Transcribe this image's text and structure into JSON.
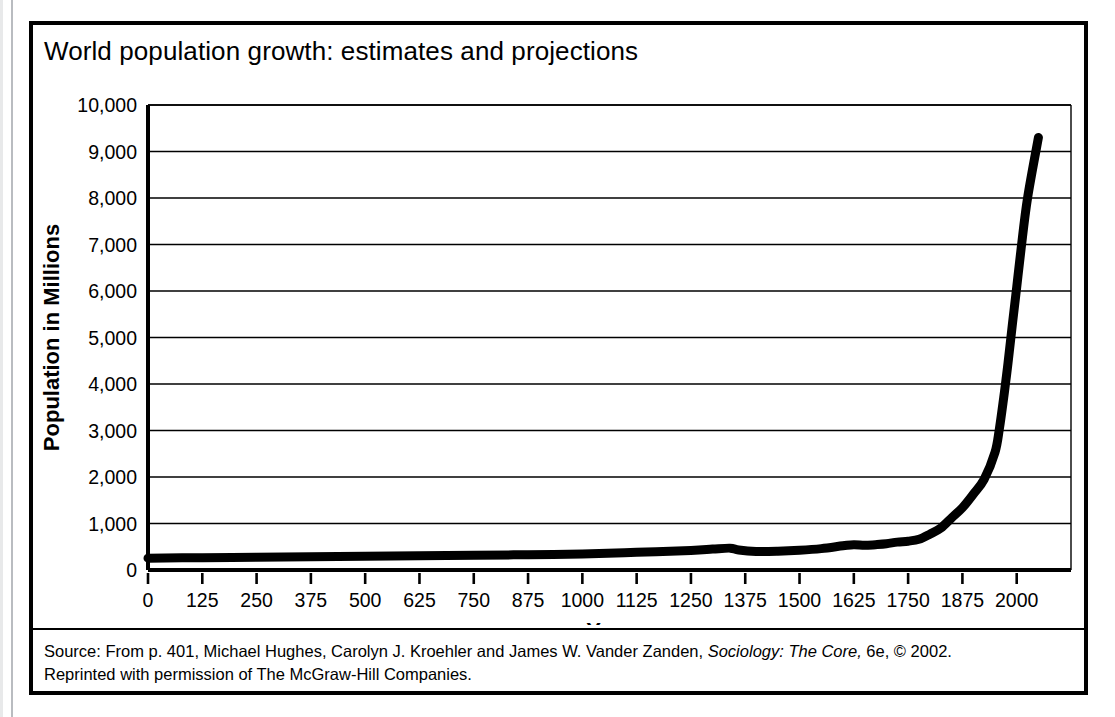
{
  "figure": {
    "title": "World population growth: estimates and projections",
    "caption_line1_pre": "Source: From p. 401, Michael Hughes, Carolyn J. Kroehler and James W. Vander Zanden, ",
    "caption_line1_italic": "Sociology: The Core,",
    "caption_line1_post": " 6e, © 2002.",
    "caption_line2": "Reprinted with permission of The McGraw-Hill Companies.",
    "frame_color": "#000000",
    "background_color": "#ffffff"
  },
  "chart_data": {
    "type": "line",
    "title": "World population growth: estimates and projections",
    "xlabel": "Year",
    "ylabel": "Population in Millions",
    "xlim": [
      0,
      2125
    ],
    "ylim": [
      0,
      10000
    ],
    "xticks": [
      0,
      125,
      250,
      375,
      500,
      625,
      750,
      875,
      1000,
      1125,
      1250,
      1375,
      1500,
      1625,
      1750,
      1875,
      2000
    ],
    "xtick_labels": [
      "0",
      "125",
      "250",
      "375",
      "500",
      "625",
      "750",
      "875",
      "1000",
      "1125",
      "1250",
      "1375",
      "1500",
      "1625",
      "1750",
      "1875",
      "2000"
    ],
    "yticks": [
      0,
      1000,
      2000,
      3000,
      4000,
      5000,
      6000,
      7000,
      8000,
      9000,
      10000
    ],
    "ytick_labels": [
      "0",
      "1,000",
      "2,000",
      "3,000",
      "4,000",
      "5,000",
      "6,000",
      "7,000",
      "8,000",
      "9,000",
      "10,000"
    ],
    "grid": "horizontal",
    "legend": null,
    "line_color": "#000000",
    "line_width": 9,
    "series": [
      {
        "name": "World population",
        "x": [
          0,
          125,
          250,
          375,
          500,
          625,
          750,
          875,
          1000,
          1125,
          1250,
          1300,
          1340,
          1360,
          1400,
          1450,
          1500,
          1550,
          1600,
          1625,
          1650,
          1675,
          1700,
          1725,
          1750,
          1775,
          1800,
          1825,
          1850,
          1875,
          1900,
          1925,
          1950,
          1960,
          1970,
          1975,
          1980,
          1990,
          2000,
          2010,
          2025,
          2050
        ],
        "y": [
          255,
          265,
          275,
          285,
          295,
          305,
          315,
          330,
          345,
          380,
          420,
          450,
          470,
          430,
          400,
          405,
          425,
          460,
          520,
          545,
          530,
          545,
          565,
          600,
          620,
          660,
          770,
          900,
          1120,
          1340,
          1630,
          1950,
          2530,
          3030,
          3700,
          4070,
          4450,
          5280,
          6080,
          6900,
          8000,
          9300
        ]
      }
    ]
  },
  "plot_geometry": {
    "svg_width": 1051,
    "svg_height": 600,
    "plot_left": 115,
    "plot_top": 80,
    "plot_right": 1038,
    "plot_bottom": 545
  }
}
